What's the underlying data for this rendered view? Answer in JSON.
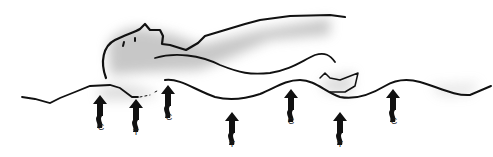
{
  "diagram": {
    "colors": {
      "ink": "#111111",
      "shade": "#9a9a9a",
      "background": "#ffffff"
    },
    "markers": [
      {
        "label": "C",
        "meaning": "crest"
      },
      {
        "label": "T",
        "meaning": "trough"
      },
      {
        "label": "C",
        "meaning": "crest"
      },
      {
        "label": "T",
        "meaning": "trough"
      },
      {
        "label": "C",
        "meaning": "crest"
      },
      {
        "label": "T",
        "meaning": "trough"
      },
      {
        "label": "C",
        "meaning": "crest"
      }
    ]
  }
}
